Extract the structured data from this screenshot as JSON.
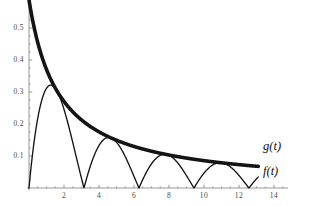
{
  "chart_data": {
    "type": "line",
    "title": "",
    "xlabel": "",
    "ylabel": "",
    "xlim": [
      0,
      14.8
    ],
    "ylim": [
      0,
      0.58
    ],
    "grid": false,
    "legend_position": "right-inline",
    "x_ticks": [
      "2",
      "4",
      "6",
      "8",
      "10",
      "12",
      "14"
    ],
    "x_tick_values": [
      2,
      4,
      6,
      8,
      10,
      12,
      14
    ],
    "y_ticks": [
      "0.1",
      "0.2",
      "0.3",
      "0.4",
      "0.5"
    ],
    "y_tick_values": [
      0.1,
      0.2,
      0.3,
      0.4,
      0.5
    ],
    "series": [
      {
        "name": "g(t)",
        "label": "g(t)",
        "style": "thick-envelope",
        "color": "#141414",
        "line_width": 3.6,
        "formula": "g(t) = 1/(t + 1.7)",
        "domain": [
          0,
          13.1
        ],
        "points": [
          {
            "t": 0.0,
            "y": 0.588
          },
          {
            "t": 0.3,
            "y": 0.5
          },
          {
            "t": 0.8,
            "y": 0.4
          },
          {
            "t": 1.4,
            "y": 0.323
          },
          {
            "t": 1.8,
            "y": 0.286
          },
          {
            "t": 2.0,
            "y": 0.27
          },
          {
            "t": 3.3,
            "y": 0.2
          },
          {
            "t": 4.6,
            "y": 0.203
          },
          {
            "t": 4.7,
            "y": 0.156
          },
          {
            "t": 6.0,
            "y": 0.13
          },
          {
            "t": 7.8,
            "y": 0.155
          },
          {
            "t": 8.0,
            "y": 0.103
          },
          {
            "t": 10.0,
            "y": 0.085
          },
          {
            "t": 11.0,
            "y": 0.137
          },
          {
            "t": 12.0,
            "y": 0.073
          },
          {
            "t": 13.1,
            "y": 0.118
          }
        ]
      },
      {
        "name": "f(t)",
        "label": "f(t)",
        "style": "thin-oscillating",
        "color": "#141414",
        "line_width": 1.35,
        "formula": "f(t) = g(t) * |sin(t)|",
        "domain": [
          0,
          13.1
        ],
        "peaks": [
          {
            "t": 1.44,
            "y": 0.322
          },
          {
            "t": 4.65,
            "y": 0.202
          },
          {
            "t": 7.77,
            "y": 0.155
          },
          {
            "t": 10.95,
            "y": 0.133
          },
          {
            "t": 13.1,
            "y": 0.055
          }
        ],
        "minima": [
          {
            "t": 0.0,
            "y": 0.0
          },
          {
            "t": 3.14,
            "y": 0.0
          },
          {
            "t": 6.28,
            "y": 0.0
          },
          {
            "t": 9.42,
            "y": 0.0
          },
          {
            "t": 12.57,
            "y": 0.0
          }
        ]
      }
    ],
    "annotations": [
      {
        "text": "g(t)",
        "t": 13.6,
        "y": 0.125
      },
      {
        "text": "f(t)",
        "t": 13.6,
        "y": 0.048
      }
    ],
    "axis_color": "#8a8a8a",
    "background": "#ffffff"
  },
  "labels": {
    "g_curve": "g(t)",
    "f_curve": "f(t)"
  }
}
